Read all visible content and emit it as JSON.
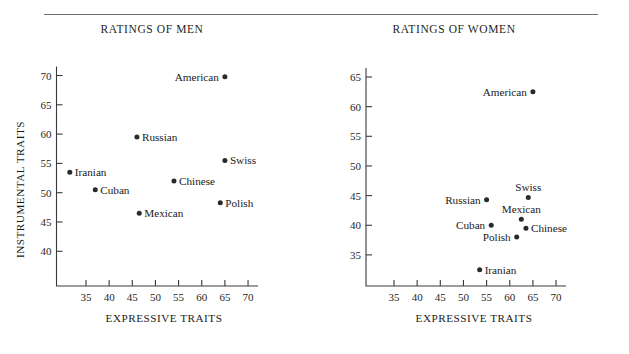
{
  "figure": {
    "has_top_rule": true,
    "background_color": "#ffffff",
    "ink_color": "#1a1a1a"
  },
  "panels": [
    {
      "key": "men",
      "title": "RATINGS OF MEN",
      "xlabel": "EXPRESSIVE TRAITS",
      "ylabel": "INSTRUMENTAL TRAITS",
      "show_ylabel": true
    },
    {
      "key": "women",
      "title": "RATINGS OF WOMEN",
      "xlabel": "EXPRESSIVE TRAITS",
      "ylabel": "",
      "show_ylabel": false
    }
  ],
  "chart_data": [
    {
      "type": "scatter",
      "title": "RATINGS OF MEN",
      "xlabel": "EXPRESSIVE TRAITS",
      "ylabel": "INSTRUMENTAL TRAITS",
      "xlim": [
        30,
        72
      ],
      "ylim": [
        37,
        72
      ],
      "xticks": [
        35,
        40,
        45,
        50,
        55,
        60,
        65,
        70
      ],
      "yticks": [
        40,
        45,
        50,
        55,
        60,
        65,
        70
      ],
      "grid": false,
      "legend": "none",
      "points": [
        {
          "label": "American",
          "x": 65.0,
          "y": 69.8,
          "label_side": "left"
        },
        {
          "label": "Russian",
          "x": 46.0,
          "y": 59.5,
          "label_side": "right"
        },
        {
          "label": "Swiss",
          "x": 65.0,
          "y": 55.5,
          "label_side": "right"
        },
        {
          "label": "Iranian",
          "x": 31.5,
          "y": 53.5,
          "label_side": "right"
        },
        {
          "label": "Chinese",
          "x": 54.0,
          "y": 52.0,
          "label_side": "right"
        },
        {
          "label": "Cuban",
          "x": 37.0,
          "y": 50.5,
          "label_side": "right"
        },
        {
          "label": "Polish",
          "x": 64.0,
          "y": 48.3,
          "label_side": "right"
        },
        {
          "label": "Mexican",
          "x": 46.5,
          "y": 46.5,
          "label_side": "right"
        }
      ]
    },
    {
      "type": "scatter",
      "title": "RATINGS OF WOMEN",
      "xlabel": "EXPRESSIVE TRAITS",
      "ylabel": "",
      "xlim": [
        30,
        72
      ],
      "ylim": [
        31,
        67
      ],
      "xticks": [
        35,
        40,
        45,
        50,
        55,
        60,
        65,
        70
      ],
      "yticks": [
        35,
        40,
        45,
        50,
        55,
        60,
        65
      ],
      "grid": false,
      "legend": "none",
      "points": [
        {
          "label": "American",
          "x": 65.0,
          "y": 62.5,
          "label_side": "left"
        },
        {
          "label": "Swiss",
          "x": 64.0,
          "y": 44.7,
          "label_side": "above"
        },
        {
          "label": "Russian",
          "x": 55.0,
          "y": 44.3,
          "label_side": "left"
        },
        {
          "label": "Mexican",
          "x": 62.5,
          "y": 41.0,
          "label_side": "above"
        },
        {
          "label": "Cuban",
          "x": 56.0,
          "y": 40.0,
          "label_side": "left"
        },
        {
          "label": "Chinese",
          "x": 63.5,
          "y": 39.5,
          "label_side": "right"
        },
        {
          "label": "Polish",
          "x": 61.5,
          "y": 38.0,
          "label_side": "left"
        },
        {
          "label": "Iranian",
          "x": 53.5,
          "y": 32.5,
          "label_side": "right"
        }
      ]
    }
  ]
}
